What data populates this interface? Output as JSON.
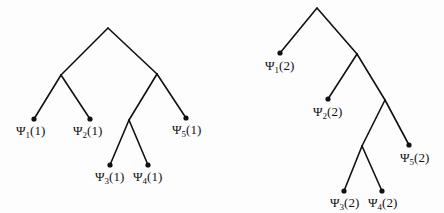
{
  "diagram": {
    "type": "binary-trees",
    "trees": [
      {
        "id": "tree-1",
        "nodes": [
          {
            "id": "root",
            "x": 108,
            "y": 28
          },
          {
            "id": "n1",
            "x": 61,
            "y": 75
          },
          {
            "id": "n2",
            "x": 157,
            "y": 74
          },
          {
            "id": "n3",
            "x": 129,
            "y": 120
          },
          {
            "id": "l1",
            "x": 34,
            "y": 119,
            "leaf": true
          },
          {
            "id": "l2",
            "x": 90,
            "y": 119,
            "leaf": true
          },
          {
            "id": "l5",
            "x": 186,
            "y": 118,
            "leaf": true
          },
          {
            "id": "l3",
            "x": 110,
            "y": 165,
            "leaf": true
          },
          {
            "id": "l4",
            "x": 148,
            "y": 165,
            "leaf": true
          }
        ],
        "edges": [
          [
            "root",
            "n1"
          ],
          [
            "root",
            "n2"
          ],
          [
            "n1",
            "l1"
          ],
          [
            "n1",
            "l2"
          ],
          [
            "n2",
            "n3"
          ],
          [
            "n2",
            "l5"
          ],
          [
            "n3",
            "l3"
          ],
          [
            "n3",
            "l4"
          ]
        ],
        "labels": [
          {
            "node": "l1",
            "sym": "Ψ",
            "sub": "1",
            "arg": "(1)",
            "x": 16,
            "y": 124
          },
          {
            "node": "l2",
            "sym": "Ψ",
            "sub": "2",
            "arg": "(1)",
            "x": 73,
            "y": 124
          },
          {
            "node": "l5",
            "sym": "Ψ",
            "sub": "5",
            "arg": "(1)",
            "x": 172,
            "y": 123
          },
          {
            "node": "l3",
            "sym": "Ψ",
            "sub": "3",
            "arg": "(1)",
            "x": 95,
            "y": 170
          },
          {
            "node": "l4",
            "sym": "Ψ",
            "sub": "4",
            "arg": "(1)",
            "x": 133,
            "y": 170
          }
        ]
      },
      {
        "id": "tree-2",
        "nodes": [
          {
            "id": "root",
            "x": 317,
            "y": 8
          },
          {
            "id": "a",
            "x": 357,
            "y": 54
          },
          {
            "id": "b",
            "x": 385,
            "y": 100
          },
          {
            "id": "c",
            "x": 362,
            "y": 146
          },
          {
            "id": "l1",
            "x": 280,
            "y": 53,
            "leaf": true
          },
          {
            "id": "l2",
            "x": 328,
            "y": 99,
            "leaf": true
          },
          {
            "id": "l5",
            "x": 409,
            "y": 145,
            "leaf": true
          },
          {
            "id": "l3",
            "x": 344,
            "y": 191,
            "leaf": true
          },
          {
            "id": "l4",
            "x": 382,
            "y": 191,
            "leaf": true
          }
        ],
        "edges": [
          [
            "root",
            "l1"
          ],
          [
            "root",
            "a"
          ],
          [
            "a",
            "l2"
          ],
          [
            "a",
            "b"
          ],
          [
            "b",
            "c"
          ],
          [
            "b",
            "l5"
          ],
          [
            "c",
            "l3"
          ],
          [
            "c",
            "l4"
          ]
        ],
        "labels": [
          {
            "node": "l1",
            "sym": "Ψ",
            "sub": "1",
            "arg": "(2)",
            "x": 265,
            "y": 59
          },
          {
            "node": "l2",
            "sym": "Ψ",
            "sub": "2",
            "arg": "(2)",
            "x": 313,
            "y": 105
          },
          {
            "node": "l5",
            "sym": "Ψ",
            "sub": "5",
            "arg": "(2)",
            "x": 400,
            "y": 151
          },
          {
            "node": "l3",
            "sym": "Ψ",
            "sub": "3",
            "arg": "(2)",
            "x": 330,
            "y": 196
          },
          {
            "node": "l4",
            "sym": "Ψ",
            "sub": "4",
            "arg": "(2)",
            "x": 368,
            "y": 196
          }
        ]
      }
    ],
    "style": {
      "line_color": "#111111",
      "background": "#fdfdfd",
      "node_radius": 2.6
    }
  }
}
